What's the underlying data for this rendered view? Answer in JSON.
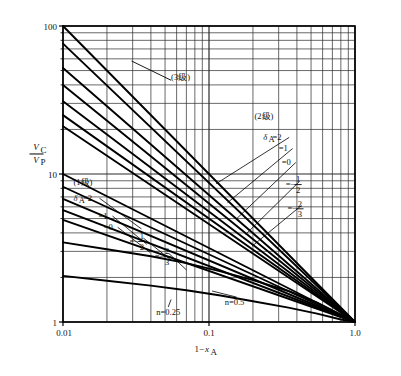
{
  "chart_data": {
    "type": "line",
    "title": "",
    "xlabel": "1-x_A",
    "ylabel": "V_C/V_P",
    "xscale": "log",
    "yscale": "log",
    "xlim": [
      0.01,
      1.0
    ],
    "ylim": [
      1,
      100
    ],
    "grid": "log-minor-major",
    "xticks": [
      "0.01",
      "0.1",
      "1.0"
    ],
    "yticks": [
      "1",
      "10",
      "100"
    ],
    "convergence_point": [
      1.0,
      1
    ],
    "legend_position": "inline-annotations",
    "groups": [
      {
        "name": "(3级)",
        "label": "(3级)",
        "label_x": 0.055,
        "label_y": 43.0,
        "leader_to": [
          0.0295,
          58.0
        ],
        "series": [
          {
            "name": "3-stage-upper",
            "x": [
              0.01,
              1.0
            ],
            "y": [
              100,
              1
            ]
          },
          {
            "name": "3-stage-lower",
            "x": [
              0.01,
              1.0
            ],
            "y": [
              76,
              1
            ]
          }
        ]
      },
      {
        "name": "(2级)",
        "label": "(2级)",
        "label_x": 0.205,
        "label_y": 23.5,
        "deltas": [
          {
            "label": "δ_A =2",
            "value": 2,
            "label_x": 0.235,
            "label_y": 17.0,
            "leader_to": [
              0.112,
              8.6
            ]
          },
          {
            "label": "=1",
            "value": 1,
            "label_x": 0.3,
            "label_y": 14.3,
            "leader_to": [
              0.134,
              6.4
            ]
          },
          {
            "label": "=0",
            "value": 0,
            "label_x": 0.315,
            "label_y": 11.5,
            "leader_to": [
              0.155,
              5.0
            ]
          },
          {
            "label": "=-1/2",
            "value": -0.5,
            "label_x": 0.335,
            "label_y": 8.6,
            "leader_to": [
              0.178,
              3.9
            ]
          },
          {
            "label": "=-2/3",
            "value": -0.6667,
            "label_x": 0.345,
            "label_y": 5.9,
            "leader_to": [
              0.197,
              3.25
            ]
          }
        ],
        "series": [
          {
            "name": "2-stage-d2",
            "x": [
              0.01,
              1.0
            ],
            "y": [
              52,
              1
            ]
          },
          {
            "name": "2-stage-d1",
            "x": [
              0.01,
              1.0
            ],
            "y": [
              40,
              1
            ]
          },
          {
            "name": "2-stage-d0",
            "x": [
              0.01,
              1.0
            ],
            "y": [
              31,
              1
            ]
          },
          {
            "name": "2-stage-dm12",
            "x": [
              0.01,
              1.0
            ],
            "y": [
              25,
              1
            ]
          },
          {
            "name": "2-stage-dm23",
            "x": [
              0.01,
              1.0
            ],
            "y": [
              21,
              1
            ]
          }
        ]
      },
      {
        "name": "(1级)",
        "label": "(1级)",
        "label_x": 0.0118,
        "label_y": 8.45,
        "deltas": [
          {
            "label": "δ_A =2",
            "value": 2,
            "label_x": 0.0118,
            "label_y": 6.6,
            "leader_to": [
              0.0345,
              4.25
            ]
          },
          {
            "label": "=1",
            "value": 1,
            "label_x": 0.0175,
            "label_y": 5.0,
            "leader_to": [
              0.0375,
              3.35
            ]
          },
          {
            "label": "=0",
            "value": 0,
            "label_x": 0.019,
            "label_y": 4.2,
            "leader_to": [
              0.0395,
              2.95
            ]
          },
          {
            "label": "=-1/2",
            "value": -0.5,
            "label_x": 0.0285,
            "label_y": 3.55,
            "leader_to": [
              0.0555,
              2.6
            ]
          },
          {
            "label": "=-2/3",
            "value": -0.6667,
            "label_x": 0.0425,
            "label_y": 2.8,
            "leader_to": [
              0.07,
              2.25
            ]
          }
        ],
        "series": [
          {
            "name": "1-stage-d2",
            "x": [
              0.01,
              1.0
            ],
            "y": [
              10.0,
              1
            ]
          },
          {
            "name": "1-stage-d1",
            "x": [
              0.01,
              1.0
            ],
            "y": [
              8.2,
              1
            ]
          },
          {
            "name": "1-stage-d0",
            "x": [
              0.01,
              1.0
            ],
            "y": [
              6.8,
              1
            ]
          },
          {
            "name": "1-stage-dm12",
            "x": [
              0.01,
              1.0
            ],
            "y": [
              5.7,
              1
            ]
          },
          {
            "name": "1-stage-dm23",
            "x": [
              0.01,
              1.0
            ],
            "y": [
              4.9,
              1
            ]
          }
        ]
      },
      {
        "name": "n-curves",
        "label": "",
        "curves": [
          {
            "name": "n=0.5",
            "label": "n=0.5",
            "label_x": 0.128,
            "label_y": 1.3,
            "leader_to": [
              0.105,
              1.62
            ],
            "x": [
              0.01,
              0.02,
              0.04,
              0.07,
              0.12,
              0.2,
              0.35,
              0.55,
              0.8,
              1.0
            ],
            "y": [
              3.45,
              3.1,
              2.78,
              2.5,
              2.2,
              1.92,
              1.62,
              1.35,
              1.12,
              1.0
            ]
          },
          {
            "name": "n=0.25",
            "label": "n=0.25",
            "label_x": 0.0435,
            "label_y": 1.115,
            "leader_to": [
              0.055,
              1.42
            ],
            "x": [
              0.01,
              0.02,
              0.04,
              0.07,
              0.12,
              0.2,
              0.35,
              0.55,
              0.8,
              1.0
            ],
            "y": [
              2.05,
              1.9,
              1.76,
              1.64,
              1.51,
              1.38,
              1.25,
              1.14,
              1.04,
              1.0
            ]
          }
        ]
      }
    ]
  },
  "axes": {
    "y_label_num": "V",
    "y_label_num_sub": "C",
    "y_label_den": "V",
    "y_label_den_sub": "P",
    "x_label_main": "1−",
    "x_label_var": "x",
    "x_label_sub": "A",
    "x_tick_left": "0.01",
    "x_tick_mid": "0.1",
    "x_tick_right": "1.0",
    "y_tick_bottom": "1",
    "y_tick_mid": "10",
    "y_tick_top": "100"
  },
  "annotations": {
    "g3": "(3级)",
    "g2": "(2级)",
    "g1": "(1级)",
    "delta_eq2": "=2",
    "delta_eq1": "=1",
    "delta_eq0": "=0",
    "eq_minus": "=−",
    "half_num": "1",
    "half_den": "2",
    "twothird_num": "2",
    "twothird_den": "3",
    "delta_sym": "δ",
    "delta_sub": "A",
    "n_half": "n=0.5",
    "n_quarter": "n=0.25"
  },
  "colors": {
    "line": "#000000",
    "grid": "#2a2a2a",
    "background": "#ffffff",
    "text": "#111111"
  }
}
